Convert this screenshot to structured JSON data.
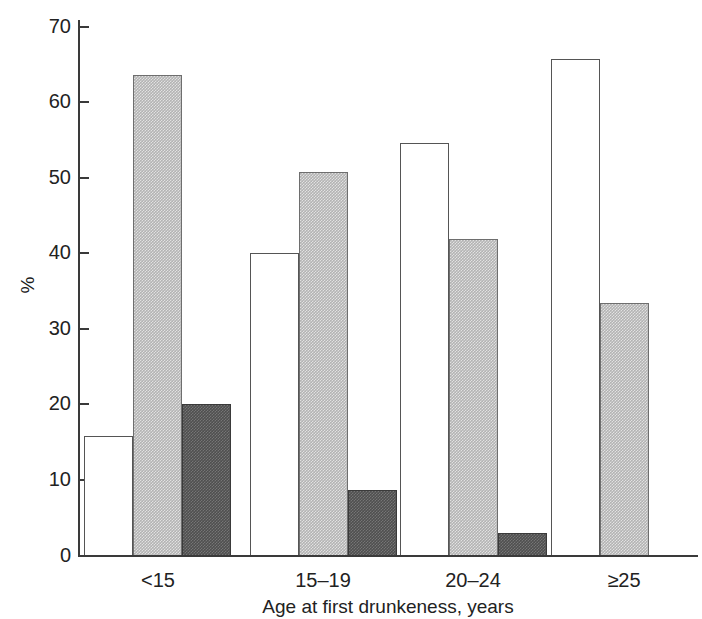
{
  "chart_data": {
    "type": "bar",
    "title": "",
    "subtitle": "",
    "xlabel": "Age at first drunkeness, years",
    "ylabel": "%",
    "ylim": [
      0,
      70
    ],
    "yticks": [
      0,
      10,
      20,
      30,
      40,
      50,
      60,
      70
    ],
    "ytick_labels": [
      "0",
      "10",
      "20",
      "30",
      "40",
      "50",
      "60",
      "70"
    ],
    "grid": false,
    "legend_position": "none",
    "categories": [
      "<15",
      "15–19",
      "20–24",
      "≥25"
    ],
    "series": [
      {
        "name": "white",
        "fill": "white",
        "values": [
          15.9,
          40.1,
          54.6,
          65.8
        ]
      },
      {
        "name": "light-gray",
        "fill": "#b3b3b3",
        "values": [
          63.7,
          50.8,
          41.9,
          33.5
        ]
      },
      {
        "name": "dark-gray",
        "fill": "#4f4f4f",
        "values": [
          20.1,
          8.8,
          3.0,
          null
        ]
      }
    ]
  },
  "axis": {
    "y_label": "%",
    "y_ticks": [
      "70",
      "60",
      "50",
      "40",
      "30",
      "20",
      "10",
      "0"
    ],
    "x_title": "Age at first drunkeness, years",
    "x_categories": [
      "<15",
      "15–19",
      "20–24",
      "≥25"
    ]
  }
}
